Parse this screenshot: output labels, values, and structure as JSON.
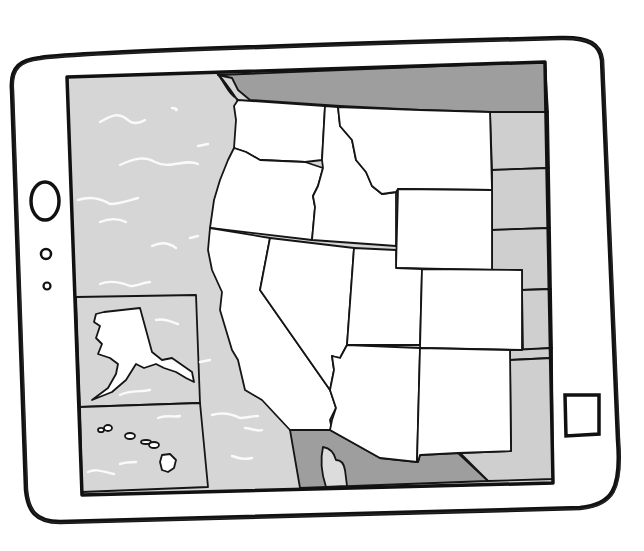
{
  "illustration": {
    "subject": "hand-drawn tablet displaying a map of the western United States",
    "colors": {
      "background": "#ffffff",
      "ink": "#111111",
      "ocean": "#d6d6d6",
      "neighbor_light": "#cfcfcf",
      "neighbor_dark": "#9e9e9e",
      "state_fill": "#ffffff",
      "wave": "#fafafa"
    },
    "tablet": {
      "home_button_icon": "home-button-icon",
      "camera_icons": [
        "front-camera-icon",
        "sensor-dot-icon"
      ],
      "side_button_icon": "square-button-icon"
    },
    "map": {
      "featured_states": [
        "Washington",
        "Oregon",
        "California",
        "Idaho",
        "Nevada",
        "Montana",
        "Wyoming",
        "Utah",
        "Colorado",
        "Arizona",
        "New Mexico"
      ],
      "insets": [
        "Alaska",
        "Hawaii"
      ],
      "dark_regions": [
        "Canada",
        "Mexico"
      ],
      "light_regions": [
        "Great Plains states",
        "Texas",
        "Baja California",
        "Pacific Ocean"
      ]
    }
  }
}
